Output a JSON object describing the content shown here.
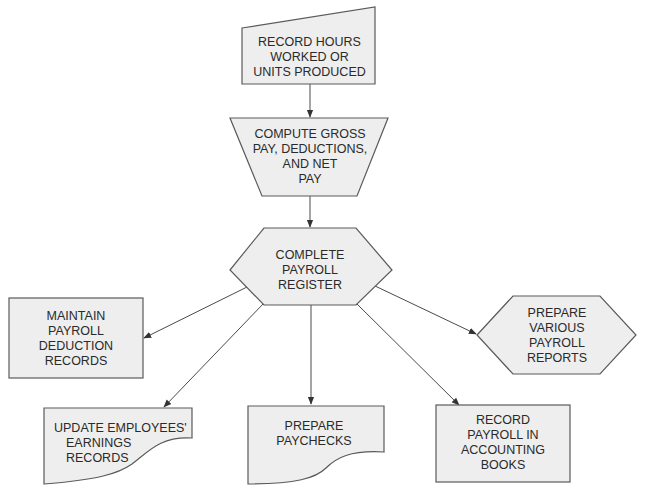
{
  "diagram": {
    "colors": {
      "fill": "#eeeeee",
      "stroke": "#5a5a5a",
      "text": "#2a2a2a",
      "background": "#ffffff"
    },
    "nodes": [
      {
        "id": "record-hours",
        "shape": "manual-input",
        "lines": [
          "RECORD HOURS",
          "WORKED OR",
          "UNITS PRODUCED"
        ]
      },
      {
        "id": "compute-gross",
        "shape": "manual-operation",
        "lines": [
          "COMPUTE GROSS",
          "PAY, DEDUCTIONS,",
          "AND NET",
          "PAY"
        ]
      },
      {
        "id": "complete-register",
        "shape": "hexagon",
        "lines": [
          "COMPLETE",
          "PAYROLL",
          "REGISTER"
        ]
      },
      {
        "id": "maintain-deduction",
        "shape": "rectangle",
        "lines": [
          "MAINTAIN",
          "PAYROLL",
          "DEDUCTION",
          "RECORDS"
        ]
      },
      {
        "id": "prepare-reports",
        "shape": "hexagon",
        "lines": [
          "PREPARE",
          "VARIOUS",
          "PAYROLL",
          "REPORTS"
        ]
      },
      {
        "id": "update-earnings",
        "shape": "document",
        "lines": [
          "UPDATE EMPLOYEES'",
          "EARNINGS",
          "RECORDS"
        ]
      },
      {
        "id": "prepare-paychecks",
        "shape": "document",
        "lines": [
          "PREPARE",
          "PAYCHECKS"
        ]
      },
      {
        "id": "record-accounting",
        "shape": "rectangle",
        "lines": [
          "RECORD",
          "PAYROLL IN",
          "ACCOUNTING",
          "BOOKS"
        ]
      }
    ],
    "edges": [
      {
        "from": "record-hours",
        "to": "compute-gross"
      },
      {
        "from": "compute-gross",
        "to": "complete-register"
      },
      {
        "from": "complete-register",
        "to": "maintain-deduction"
      },
      {
        "from": "complete-register",
        "to": "update-earnings"
      },
      {
        "from": "complete-register",
        "to": "prepare-paychecks"
      },
      {
        "from": "complete-register",
        "to": "record-accounting"
      },
      {
        "from": "complete-register",
        "to": "prepare-reports"
      }
    ]
  }
}
